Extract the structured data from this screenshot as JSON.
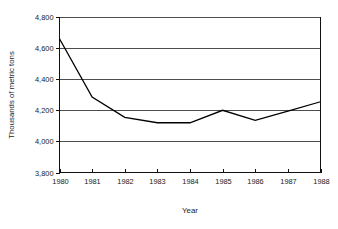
{
  "chart_data": {
    "type": "line",
    "title": "",
    "xlabel": "Year",
    "ylabel": "Thousands of metric tons",
    "x": [
      1980,
      1981,
      1982,
      1983,
      1984,
      1985,
      1986,
      1987,
      1988
    ],
    "xticklabels": [
      "1980",
      "1981",
      "1982",
      "1983",
      "1984",
      "1985",
      "1986",
      "1987",
      "1988"
    ],
    "values": [
      4660,
      4285,
      4155,
      4120,
      4120,
      4200,
      4135,
      4195,
      4255
    ],
    "yticks": [
      3800,
      4000,
      4200,
      4400,
      4600,
      4800
    ],
    "yticklabels": [
      "3,800",
      "4,000",
      "4,200",
      "4,400",
      "4,600",
      "4,800"
    ],
    "ylim": [
      3800,
      4800
    ],
    "xlim": [
      1980,
      1988
    ],
    "grid": "horizontal",
    "legend": "none",
    "series": [
      {
        "name": "Thousands of metric tons",
        "values": [
          4660,
          4285,
          4155,
          4120,
          4120,
          4200,
          4135,
          4195,
          4255
        ],
        "color": "#000000"
      }
    ],
    "colors": {
      "line": "#000000",
      "gridline": "#3a3a3a",
      "frame": "#111111",
      "text": "#1a1a1a",
      "background": "#ffffff"
    }
  }
}
